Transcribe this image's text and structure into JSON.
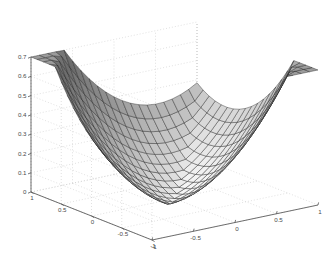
{
  "figure": {
    "name": "matlab-3d-surface-plot",
    "background_color": "#ffffff",
    "axis_line_color": "#555555",
    "grid_color": "#cccccc",
    "tick_label_color": "#4a4a4a",
    "mesh_line_color": "#1a1a1a",
    "surface_light_color": "#e8e8e8",
    "surface_dark_color": "#4d4d4d",
    "title": "",
    "xlabel": "",
    "ylabel": "",
    "zlabel": ""
  },
  "chart_data": {
    "type": "surface",
    "title": "",
    "xlabel": "",
    "ylabel": "",
    "zlabel": "",
    "xlim": [
      -1,
      1
    ],
    "ylim": [
      -1,
      1
    ],
    "zlim": [
      0,
      0.7
    ],
    "grid": true,
    "legend": false,
    "projection": "3d",
    "view": {
      "azimuth": -37.5,
      "elevation": 30
    },
    "colormap": "gray",
    "shading": "faceted",
    "mesh_n": 20,
    "function": "z = ((|x| + |y|)^2) / 4 * 0.7 / 1 ... bowl with diagonal crease ridge",
    "x_ticks": [
      -1,
      -0.5,
      0,
      0.5,
      1
    ],
    "y_ticks": [
      -1,
      -0.5,
      0,
      0.5,
      1
    ],
    "z_ticks": [
      0,
      0.1,
      0.2,
      0.3,
      0.4,
      0.5,
      0.6,
      0.7
    ],
    "x_tick_labels": [
      "-1",
      "-0.5",
      "0",
      "0.5",
      "1"
    ],
    "y_tick_labels": [
      "1",
      "0.5",
      "0",
      "-0.5",
      "-1"
    ],
    "z_tick_labels": [
      "0",
      "0.1",
      "0.2",
      "0.3",
      "0.4",
      "0.5",
      "0.6",
      "0.7"
    ]
  },
  "axes": {
    "z_axis": {
      "name": "z-axis",
      "ticks": [
        "0",
        "0.1",
        "0.2",
        "0.3",
        "0.4",
        "0.5",
        "0.6",
        "0.7"
      ],
      "min": 0,
      "max": 0.7
    },
    "left_axis": {
      "name": "y-axis",
      "ticks": [
        "1",
        "0.5",
        "0",
        "-0.5",
        "-1"
      ],
      "min": -1,
      "max": 1
    },
    "right_axis": {
      "name": "x-axis",
      "ticks": [
        "-1",
        "-0.5",
        "0",
        "0.5",
        "1"
      ],
      "min": -1,
      "max": 1
    }
  }
}
